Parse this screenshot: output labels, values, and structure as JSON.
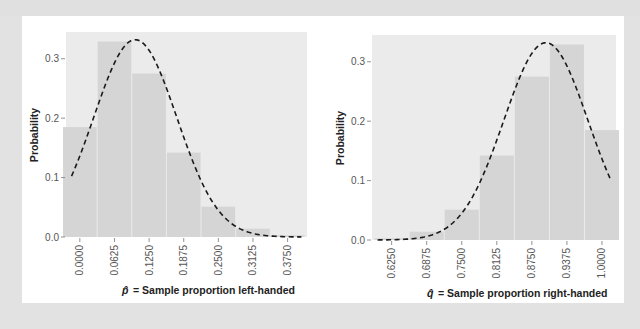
{
  "colors": {
    "page_background": "#e2e2e2",
    "card_background": "#ffffff",
    "panel_background": "#ebebeb",
    "bar_fill": "#d5d5d5",
    "bar_separator": "#f4f4f4",
    "curve": "#1a1a1a",
    "tick_text": "#555555",
    "axis_title": "#222222"
  },
  "chart_data": [
    {
      "type": "bar",
      "id": "left-handed",
      "title": "",
      "xlabel_symbol": "p̂",
      "xlabel": "= Sample proportion left-handed",
      "ylabel": "Probability",
      "categories": [
        "0.0000",
        "0.0625",
        "0.1250",
        "0.1875",
        "0.2500",
        "0.3125",
        "0.3750"
      ],
      "x": [
        0.0,
        0.0625,
        0.125,
        0.1875,
        0.25,
        0.3125,
        0.375
      ],
      "values": [
        0.185,
        0.329,
        0.275,
        0.142,
        0.051,
        0.014,
        0.003
      ],
      "yticks": [
        "0.0",
        "0.1",
        "0.2",
        "0.3"
      ],
      "ytick_values": [
        0.0,
        0.1,
        0.2,
        0.3
      ],
      "ylim": [
        0,
        0.345
      ],
      "xlim": [
        -0.025,
        0.41
      ],
      "overlay": {
        "type": "normal-curve",
        "style": "dashed",
        "mean": 0.1,
        "sd": 0.075,
        "peak": 0.332
      },
      "grid": false,
      "legend": "none"
    },
    {
      "type": "bar",
      "id": "right-handed",
      "title": "",
      "xlabel_symbol": "q̂",
      "xlabel": "= Sample proportion right-handed",
      "ylabel": "Probability",
      "categories": [
        "0.6250",
        "0.6875",
        "0.7500",
        "0.8125",
        "0.8750",
        "0.9375",
        "1.0000"
      ],
      "x": [
        0.625,
        0.6875,
        0.75,
        0.8125,
        0.875,
        0.9375,
        1.0
      ],
      "values": [
        0.003,
        0.014,
        0.051,
        0.142,
        0.275,
        0.329,
        0.185
      ],
      "yticks": [
        "0.0",
        "0.1",
        "0.2",
        "0.3"
      ],
      "ytick_values": [
        0.0,
        0.1,
        0.2,
        0.3
      ],
      "ylim": [
        0,
        0.345
      ],
      "xlim": [
        0.59,
        1.025
      ],
      "overlay": {
        "type": "normal-curve",
        "style": "dashed",
        "mean": 0.9,
        "sd": 0.075,
        "peak": 0.332
      },
      "grid": false,
      "legend": "none"
    }
  ]
}
